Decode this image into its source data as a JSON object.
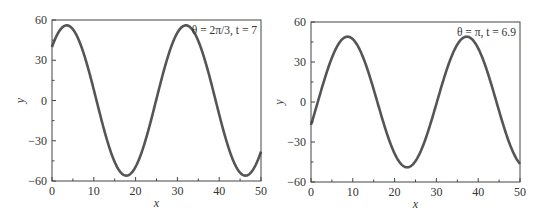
{
  "chart_data": [
    {
      "type": "line",
      "title": "",
      "annotation": "θ = 2π/3, t = 7",
      "xlabel": "x",
      "ylabel": "y",
      "xlim": [
        0,
        50
      ],
      "ylim": [
        -60,
        60
      ],
      "xticks": [
        0,
        10,
        20,
        30,
        40,
        50
      ],
      "yticks": [
        -60,
        -30,
        0,
        30,
        60
      ],
      "xtick_labels": [
        "0",
        "10",
        "20",
        "30",
        "40",
        "50"
      ],
      "ytick_labels": [
        "−60",
        "−30",
        "0",
        "30",
        "60"
      ],
      "grid": false,
      "legend": "none",
      "series": [
        {
          "name": "θ = 2π/3, t = 7",
          "color": "#555555",
          "model": {
            "amplitude": 56,
            "period": 28.5,
            "shift": 3.6,
            "form": "A*sin(2*pi*(x+shift)/period)"
          },
          "x": [
            0,
            3.5,
            10.6,
            17.75,
            24.9,
            32,
            39.1,
            46.25,
            50
          ],
          "values": [
            40,
            56,
            0,
            -56,
            0,
            56,
            0,
            -56,
            -38
          ]
        }
      ]
    },
    {
      "type": "line",
      "title": "",
      "annotation": "θ = π, t = 6.9",
      "xlabel": "x",
      "ylabel": "y",
      "xlim": [
        0,
        50
      ],
      "ylim": [
        -60,
        60
      ],
      "xticks": [
        0,
        10,
        20,
        30,
        40,
        50
      ],
      "yticks": [
        -60,
        -30,
        0,
        30,
        60
      ],
      "xtick_labels": [
        "0",
        "10",
        "20",
        "30",
        "40",
        "50"
      ],
      "ytick_labels": [
        "−60",
        "−30",
        "0",
        "30",
        "60"
      ],
      "grid": false,
      "legend": "none",
      "series": [
        {
          "name": "θ = π, t = 6.9",
          "color": "#555555",
          "model": {
            "amplitude": 49,
            "period": 28.5,
            "shift": -1.625,
            "form": "A*sin(2*pi*(x+shift)/period)"
          },
          "x": [
            0,
            5.5,
            12.6,
            19.75,
            26.9,
            34,
            41.1,
            48.25,
            50
          ],
          "values": [
            17,
            49,
            0,
            -49,
            0,
            49,
            0,
            -49,
            -46
          ]
        }
      ]
    }
  ]
}
